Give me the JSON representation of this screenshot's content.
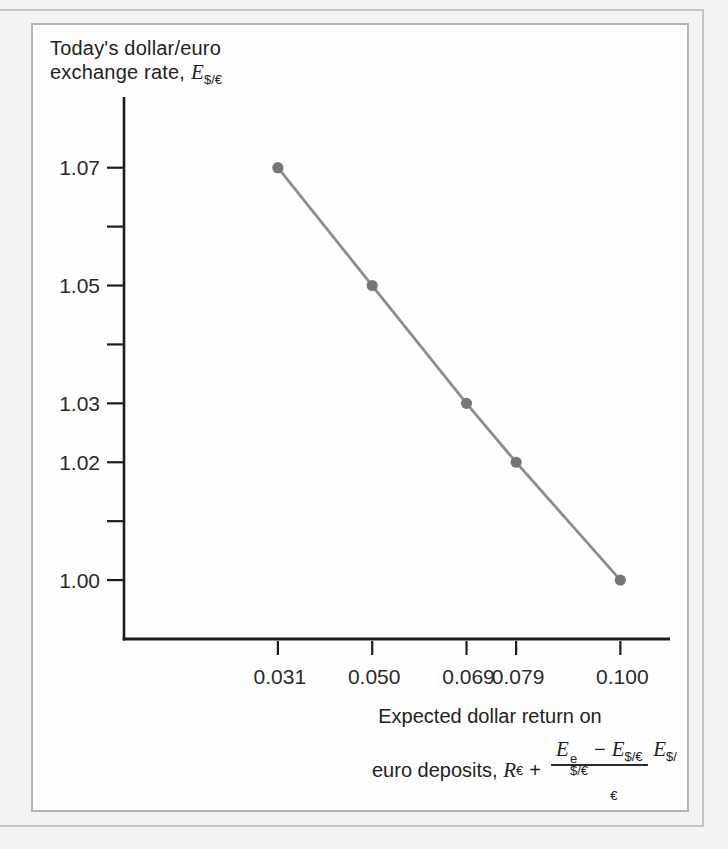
{
  "figure": {
    "y_axis_title": {
      "line1": "Today's dollar/euro",
      "line2_text": "exchange rate, ",
      "line2_var": "E",
      "line2_var_sub": "$/€"
    },
    "x_axis_title": {
      "line1": "Expected dollar return on",
      "line2_text": "euro deposits, ",
      "var_R": "R",
      "var_R_sub": "€",
      "plus": "+",
      "fraction": {
        "num_E1": "E",
        "num_E1_sup": "e",
        "num_E1_sub": "$/€",
        "minus": "−",
        "num_E2": "E",
        "num_E2_sub": "$/€",
        "den_E": "E",
        "den_E_sub": "$/€"
      }
    }
  },
  "chart_data": {
    "type": "line",
    "title": "",
    "xlabel": "Expected dollar return on euro deposits, R€ + (E^e$/€ − E$/€)/E$/€",
    "ylabel": "Today's dollar/euro exchange rate, E$/€",
    "x": [
      0.031,
      0.05,
      0.069,
      0.079,
      0.1
    ],
    "y": [
      1.07,
      1.05,
      1.03,
      1.02,
      1.0
    ],
    "x_ticks": [
      {
        "value": 0.031,
        "label": "0.031"
      },
      {
        "value": 0.05,
        "label": "0.050"
      },
      {
        "value": 0.069,
        "label": "0.069"
      },
      {
        "value": 0.079,
        "label": "0.079"
      },
      {
        "value": 0.1,
        "label": "0.100"
      }
    ],
    "y_ticks": [
      {
        "value": 1.0,
        "label": "1.00"
      },
      {
        "value": 1.01,
        "label": ""
      },
      {
        "value": 1.02,
        "label": "1.02"
      },
      {
        "value": 1.03,
        "label": "1.03"
      },
      {
        "value": 1.04,
        "label": ""
      },
      {
        "value": 1.05,
        "label": "1.05"
      },
      {
        "value": 1.06,
        "label": ""
      },
      {
        "value": 1.07,
        "label": "1.07"
      }
    ],
    "xlim": [
      0,
      0.11
    ],
    "ylim": [
      0.99,
      1.082
    ],
    "grid": false,
    "legend": null,
    "colors": {
      "line": "#8d8d8d",
      "point": "#767676",
      "axis": "#1c1c1c",
      "text": "#2a2a2a"
    }
  }
}
